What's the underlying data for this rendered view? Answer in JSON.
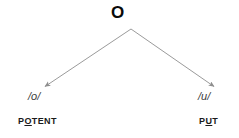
{
  "diagram": {
    "type": "phoneme-split-tree",
    "background_color": "#ffffff",
    "root": {
      "label": "O",
      "color": "#0a0a0a"
    },
    "branches": [
      {
        "side": "left",
        "phoneme": "/o/",
        "word_prefix": "P",
        "word_highlight": "O",
        "word_suffix": "TENT",
        "word_full": "POTENT"
      },
      {
        "side": "right",
        "phoneme": "/u/",
        "word_prefix": "P",
        "word_highlight": "U",
        "word_suffix": "T",
        "word_full": "PUT"
      }
    ],
    "arrows": {
      "stroke_color": "#8e8e8e",
      "apex_x": 131,
      "apex_y": 29,
      "left_end_x": 43,
      "left_end_y": 88,
      "right_end_x": 216,
      "right_end_y": 88
    }
  }
}
